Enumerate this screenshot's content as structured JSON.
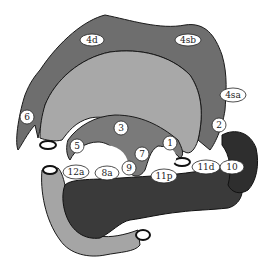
{
  "diagram": {
    "title": "",
    "colors": {
      "omentum": "#6e6e6e",
      "stomach": "#a8a8a8",
      "lesser_curve": "#7a7a7a",
      "pancreas": "#3a3a3a",
      "spleen": "#2e2e2e",
      "duodenum": "#a5a5a5",
      "node_fill": "#ffffff",
      "outline": "#1a1a1a"
    },
    "nodes": [
      {
        "id": "4d",
        "label": "4d"
      },
      {
        "id": "4sb",
        "label": "4sb"
      },
      {
        "id": "4sa",
        "label": "4sa"
      },
      {
        "id": "6",
        "label": "6"
      },
      {
        "id": "2",
        "label": "2"
      },
      {
        "id": "3",
        "label": "3"
      },
      {
        "id": "5",
        "label": "5"
      },
      {
        "id": "1",
        "label": "1"
      },
      {
        "id": "7",
        "label": "7"
      },
      {
        "id": "9",
        "label": "9"
      },
      {
        "id": "12a",
        "label": "12a"
      },
      {
        "id": "8a",
        "label": "8a"
      },
      {
        "id": "11p",
        "label": "11p"
      },
      {
        "id": "11d",
        "label": "11d"
      },
      {
        "id": "10",
        "label": "10"
      }
    ]
  }
}
